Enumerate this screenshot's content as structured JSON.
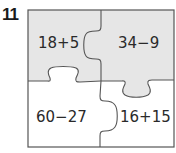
{
  "problem": {
    "number": "11"
  },
  "puzzle": {
    "colors": {
      "shaded": "#e6e6e6",
      "unshaded": "#ffffff",
      "border": "#555555",
      "text": "#2a2a2a"
    },
    "pieces": [
      {
        "position": "top-left",
        "expression": "18+5",
        "shaded": true
      },
      {
        "position": "top-right",
        "expression": "34−9",
        "shaded": true
      },
      {
        "position": "bottom-left",
        "expression": "60−27",
        "shaded": false
      },
      {
        "position": "bottom-right",
        "expression": "16+15",
        "shaded": false
      }
    ]
  }
}
